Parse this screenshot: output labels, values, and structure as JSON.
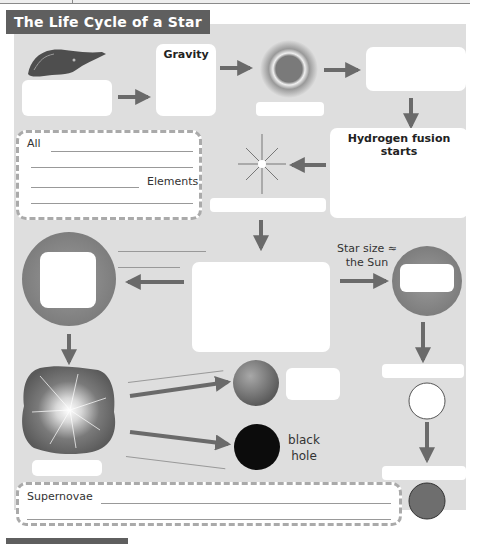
{
  "header": {
    "title": "The Life Cycle of a Star"
  },
  "stages": {
    "nebula": {
      "icon": "nebula-icon",
      "label": ""
    },
    "gravity": {
      "heading": "Gravity",
      "content": ""
    },
    "protostar": {
      "icon": "protostar-icon",
      "label": ""
    },
    "box_top_right": {
      "content": ""
    },
    "hydrogen": {
      "heading": "Hydrogen fusion starts",
      "content": ""
    },
    "new_star": {
      "icon": "sparkle-star-icon",
      "label": ""
    },
    "main_sequence": {
      "content": ""
    },
    "red_supergiant": {
      "icon": "supergiant-icon",
      "label": ""
    },
    "red_giant": {
      "icon": "red-giant-icon",
      "label": ""
    },
    "supernova": {
      "icon": "supernova-icon",
      "label": ""
    },
    "neutron_star": {
      "icon": "neutron-star-icon",
      "label": ""
    },
    "black_hole": {
      "icon": "black-hole-icon",
      "label": "black\nhole",
      "line1": "black",
      "line2": "hole"
    },
    "white_dwarf": {
      "icon": "white-dwarf-icon",
      "label": ""
    },
    "black_dwarf": {
      "icon": "black-dwarf-icon",
      "label": ""
    }
  },
  "notes": {
    "sun_size": {
      "line1": "Star size ≈",
      "line2": "the Sun"
    }
  },
  "fill_in": {
    "elements": {
      "start": "All",
      "end": "Elements"
    },
    "supernovae": {
      "start": "Supernovae"
    }
  },
  "colors": {
    "panel": "#dedede",
    "title_bg": "#5f5f5f",
    "arrow": "#6a6a6a",
    "box": "#ffffff"
  }
}
